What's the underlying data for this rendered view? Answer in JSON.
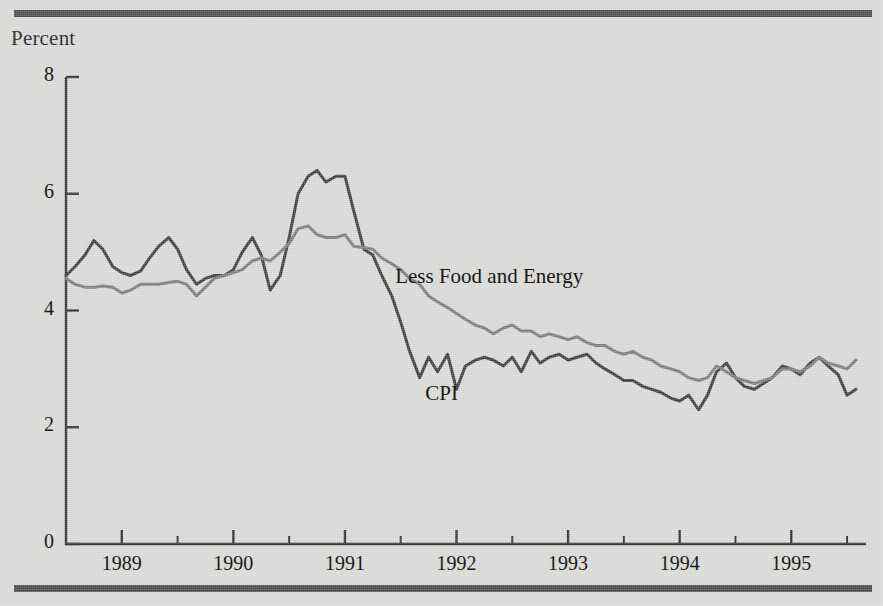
{
  "figure": {
    "y_axis_title": "Percent",
    "rules": {
      "color": "#4a4a4a"
    },
    "background_color": "#d9d9d7"
  },
  "chart_data": {
    "type": "line",
    "title": "",
    "subtitle": "",
    "xlabel": "",
    "ylabel": "Percent",
    "ylim": [
      0,
      8
    ],
    "xlim": [
      1988.5,
      1995.67
    ],
    "yticks": [
      0,
      2,
      4,
      6,
      8
    ],
    "ytick_labels": [
      "0",
      "2",
      "4",
      "6",
      "8"
    ],
    "xticks": [
      1989,
      1990,
      1991,
      1992,
      1993,
      1994,
      1995
    ],
    "xtick_labels": [
      "1989",
      "1990",
      "1991",
      "1992",
      "1993",
      "1994",
      "1995"
    ],
    "xminor_interval": 0.5,
    "grid": false,
    "legend": "inline-annotations",
    "annotations": [
      {
        "text": "Less Food and Energy",
        "x": 1991.45,
        "y": 4.55,
        "series": "Less Food and Energy"
      },
      {
        "text": "CPI",
        "x": 1991.72,
        "y": 2.55,
        "series": "CPI"
      }
    ],
    "series": [
      {
        "name": "CPI",
        "color": "#3c3c3c",
        "width": 3,
        "x": [
          1988.5,
          1988.58,
          1988.67,
          1988.75,
          1988.83,
          1988.92,
          1989.0,
          1989.08,
          1989.17,
          1989.25,
          1989.33,
          1989.42,
          1989.5,
          1989.58,
          1989.67,
          1989.75,
          1989.83,
          1989.92,
          1990.0,
          1990.08,
          1990.17,
          1990.25,
          1990.33,
          1990.42,
          1990.5,
          1990.58,
          1990.67,
          1990.75,
          1990.83,
          1990.92,
          1991.0,
          1991.08,
          1991.17,
          1991.25,
          1991.33,
          1991.42,
          1991.5,
          1991.58,
          1991.67,
          1991.75,
          1991.83,
          1991.92,
          1992.0,
          1992.08,
          1992.17,
          1992.25,
          1992.33,
          1992.42,
          1992.5,
          1992.58,
          1992.67,
          1992.75,
          1992.83,
          1992.92,
          1993.0,
          1993.08,
          1993.17,
          1993.25,
          1993.33,
          1993.42,
          1993.5,
          1993.58,
          1993.67,
          1993.75,
          1993.83,
          1993.92,
          1994.0,
          1994.08,
          1994.17,
          1994.25,
          1994.33,
          1994.42,
          1994.5,
          1994.58,
          1994.67,
          1994.75,
          1994.83,
          1994.92,
          1995.0,
          1995.08,
          1995.17,
          1995.25,
          1995.33,
          1995.42,
          1995.5,
          1995.58
        ],
        "y": [
          4.6,
          4.75,
          4.95,
          5.2,
          5.05,
          4.75,
          4.65,
          4.6,
          4.68,
          4.9,
          5.1,
          5.25,
          5.05,
          4.7,
          4.45,
          4.55,
          4.6,
          4.6,
          4.7,
          5.0,
          5.25,
          4.95,
          4.35,
          4.6,
          5.25,
          6.0,
          6.3,
          6.4,
          6.2,
          6.3,
          6.3,
          5.7,
          5.05,
          4.95,
          4.6,
          4.25,
          3.8,
          3.3,
          2.85,
          3.2,
          2.95,
          3.25,
          2.65,
          3.05,
          3.15,
          3.2,
          3.15,
          3.05,
          3.2,
          2.95,
          3.3,
          3.1,
          3.2,
          3.25,
          3.15,
          3.2,
          3.25,
          3.1,
          3.0,
          2.9,
          2.8,
          2.8,
          2.7,
          2.65,
          2.6,
          2.5,
          2.45,
          2.55,
          2.3,
          2.55,
          2.95,
          3.1,
          2.85,
          2.7,
          2.65,
          2.75,
          2.85,
          3.05,
          3.0,
          2.9,
          3.1,
          3.2,
          3.05,
          2.9,
          2.55,
          2.65
        ]
      },
      {
        "name": "Less Food and Energy",
        "color": "#7c7c7c",
        "width": 3,
        "x": [
          1988.5,
          1988.58,
          1988.67,
          1988.75,
          1988.83,
          1988.92,
          1989.0,
          1989.08,
          1989.17,
          1989.25,
          1989.33,
          1989.42,
          1989.5,
          1989.58,
          1989.67,
          1989.75,
          1989.83,
          1989.92,
          1990.0,
          1990.08,
          1990.17,
          1990.25,
          1990.33,
          1990.42,
          1990.5,
          1990.58,
          1990.67,
          1990.75,
          1990.83,
          1990.92,
          1991.0,
          1991.08,
          1991.17,
          1991.25,
          1991.33,
          1991.42,
          1991.5,
          1991.58,
          1991.67,
          1991.75,
          1991.83,
          1991.92,
          1992.0,
          1992.08,
          1992.17,
          1992.25,
          1992.33,
          1992.42,
          1992.5,
          1992.58,
          1992.67,
          1992.75,
          1992.83,
          1992.92,
          1993.0,
          1993.08,
          1993.17,
          1993.25,
          1993.33,
          1993.42,
          1993.5,
          1993.58,
          1993.67,
          1993.75,
          1993.83,
          1993.92,
          1994.0,
          1994.08,
          1994.17,
          1994.25,
          1994.33,
          1994.42,
          1994.5,
          1994.58,
          1994.67,
          1994.75,
          1994.83,
          1994.92,
          1995.0,
          1995.08,
          1995.17,
          1995.25,
          1995.33,
          1995.42,
          1995.5,
          1995.58
        ],
        "y": [
          4.55,
          4.45,
          4.4,
          4.4,
          4.42,
          4.4,
          4.3,
          4.35,
          4.45,
          4.45,
          4.45,
          4.48,
          4.5,
          4.45,
          4.25,
          4.4,
          4.55,
          4.6,
          4.65,
          4.7,
          4.85,
          4.9,
          4.85,
          5.0,
          5.15,
          5.4,
          5.45,
          5.3,
          5.25,
          5.25,
          5.3,
          5.1,
          5.08,
          5.05,
          4.9,
          4.8,
          4.7,
          4.55,
          4.45,
          4.25,
          4.15,
          4.05,
          3.95,
          3.85,
          3.75,
          3.7,
          3.6,
          3.7,
          3.75,
          3.65,
          3.65,
          3.55,
          3.6,
          3.55,
          3.5,
          3.55,
          3.45,
          3.4,
          3.4,
          3.3,
          3.25,
          3.3,
          3.2,
          3.15,
          3.05,
          3.0,
          2.95,
          2.85,
          2.8,
          2.85,
          3.05,
          2.95,
          2.85,
          2.8,
          2.75,
          2.8,
          2.85,
          3.0,
          3.0,
          2.95,
          3.05,
          3.2,
          3.1,
          3.05,
          3.0,
          3.15
        ]
      }
    ]
  }
}
